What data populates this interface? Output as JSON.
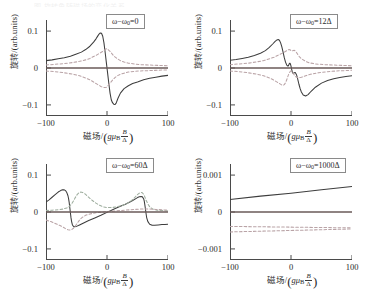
{
  "figure": {
    "caption_strip": "图 旋转角随磁场的变化关系",
    "axis": {
      "xlabel_cn": "磁场",
      "xlabel_slash": "/",
      "xlabel_g": "g",
      "xlabel_mu": "μ",
      "xlabel_mu_sub": "B",
      "xlabel_frac_num": "B",
      "xlabel_frac_den": "Δ",
      "ylabel_cn": "旋转",
      "ylabel_units": "/(arb.units)"
    },
    "xticks": [
      "-100",
      "0",
      "100"
    ],
    "xlim": [
      -100,
      100
    ]
  },
  "chart_data": [
    {
      "id": "panel-tl",
      "type": "line",
      "title": "",
      "annotation": "ω−ω₀=0",
      "annotation_prefix": "ω−ω",
      "annotation_sub": "0",
      "annotation_value": "=0",
      "xlabel": "磁场/(gμB B/Δ)",
      "ylabel": "旋转/(arb.units)",
      "xlim": [
        -100,
        100
      ],
      "ylim": [
        -0.13,
        0.13
      ],
      "yticks": [
        "0.1",
        "0",
        "-0.1"
      ],
      "ytick_values": [
        0.1,
        0,
        -0.1
      ],
      "grid": false,
      "legend": "none",
      "series": [
        {
          "name": "solid-dispersive",
          "style": "solid",
          "color": "#3d3d3d",
          "x": [
            -100,
            -90,
            -80,
            -70,
            -60,
            -50,
            -42,
            -35,
            -28,
            -22,
            -18,
            -15,
            -13,
            -11,
            -9,
            -7,
            -5,
            -3,
            -1,
            0,
            1,
            3,
            5,
            7,
            9,
            11,
            13,
            15,
            18,
            22,
            28,
            35,
            42,
            50,
            60,
            70,
            80,
            90,
            100
          ],
          "y": [
            0.02,
            0.022,
            0.025,
            0.028,
            0.032,
            0.038,
            0.043,
            0.05,
            0.059,
            0.07,
            0.079,
            0.087,
            0.092,
            0.095,
            0.094,
            0.086,
            0.068,
            0.042,
            0.014,
            0.0,
            -0.014,
            -0.042,
            -0.068,
            -0.086,
            -0.094,
            -0.098,
            -0.099,
            -0.095,
            -0.082,
            -0.068,
            -0.056,
            -0.048,
            -0.042,
            -0.038,
            -0.032,
            -0.028,
            -0.025,
            -0.022,
            -0.02
          ]
        },
        {
          "name": "dashed-upper",
          "style": "dashed",
          "color": "#b9a3a6",
          "x": [
            -100,
            -85,
            -70,
            -55,
            -45,
            -35,
            -28,
            -22,
            -17,
            -13,
            -10,
            -7,
            -5,
            -3,
            -1,
            0,
            1,
            3,
            5,
            7,
            10,
            13,
            17,
            22,
            28,
            35,
            45,
            55,
            70,
            85,
            100
          ],
          "y": [
            0.008,
            0.01,
            0.012,
            0.015,
            0.018,
            0.022,
            0.026,
            0.031,
            0.035,
            0.039,
            0.042,
            0.045,
            0.047,
            0.05,
            0.052,
            0.052,
            0.051,
            0.048,
            0.045,
            0.041,
            0.035,
            0.03,
            0.025,
            0.02,
            0.016,
            0.013,
            0.011,
            0.009,
            0.008,
            0.007,
            0.006
          ]
        },
        {
          "name": "dashed-lower",
          "style": "dashed",
          "color": "#b9a3a6",
          "x": [
            -100,
            -85,
            -70,
            -55,
            -45,
            -35,
            -28,
            -22,
            -17,
            -13,
            -10,
            -7,
            -5,
            -3,
            -1,
            0,
            1,
            3,
            5,
            7,
            10,
            13,
            17,
            22,
            28,
            35,
            45,
            55,
            70,
            85,
            100
          ],
          "y": [
            -0.008,
            -0.01,
            -0.013,
            -0.017,
            -0.021,
            -0.027,
            -0.032,
            -0.038,
            -0.043,
            -0.047,
            -0.05,
            -0.052,
            -0.053,
            -0.053,
            -0.052,
            -0.051,
            -0.049,
            -0.045,
            -0.041,
            -0.037,
            -0.031,
            -0.026,
            -0.021,
            -0.017,
            -0.014,
            -0.011,
            -0.009,
            -0.008,
            -0.007,
            -0.006,
            -0.005
          ]
        },
        {
          "name": "zero-baseline",
          "style": "solid",
          "color": "#6a5a58",
          "x": [
            -100,
            100
          ],
          "y": [
            0,
            0
          ]
        }
      ]
    },
    {
      "id": "panel-tr",
      "type": "line",
      "title": "",
      "annotation": "ω−ω₀=12Δ",
      "annotation_prefix": "ω−ω",
      "annotation_sub": "0",
      "annotation_value": "=12Δ",
      "xlabel": "磁场/(gμB B/Δ)",
      "ylabel": "旋转/(arb.units)",
      "xlim": [
        -100,
        100
      ],
      "ylim": [
        -0.13,
        0.13
      ],
      "yticks": [
        "0.1",
        "0",
        "-0.1"
      ],
      "ytick_values": [
        0.1,
        0,
        -0.1
      ],
      "grid": false,
      "legend": "none",
      "series": [
        {
          "name": "solid-dispersive",
          "style": "solid",
          "color": "#3d3d3d",
          "x": [
            -100,
            -90,
            -80,
            -70,
            -60,
            -50,
            -42,
            -36,
            -30,
            -26,
            -23,
            -21,
            -19,
            -17,
            -15,
            -13,
            -11,
            -9,
            -7,
            -5,
            -4,
            -3,
            -2,
            -1,
            0,
            1,
            2,
            3,
            4,
            5,
            7,
            9,
            11,
            13,
            15,
            17,
            20,
            24,
            28,
            33,
            40,
            50,
            60,
            70,
            80,
            90,
            100
          ],
          "y": [
            0.021,
            0.023,
            0.026,
            0.029,
            0.034,
            0.04,
            0.047,
            0.055,
            0.065,
            0.072,
            0.076,
            0.077,
            0.075,
            0.068,
            0.057,
            0.043,
            0.028,
            0.016,
            0.008,
            0.005,
            0.007,
            0.011,
            0.013,
            0.011,
            0.005,
            -0.003,
            -0.01,
            -0.014,
            -0.015,
            -0.013,
            -0.012,
            -0.018,
            -0.03,
            -0.044,
            -0.056,
            -0.065,
            -0.073,
            -0.076,
            -0.072,
            -0.063,
            -0.052,
            -0.041,
            -0.034,
            -0.029,
            -0.026,
            -0.023,
            -0.021
          ]
        },
        {
          "name": "dashed-upper",
          "style": "dashed",
          "color": "#b9a3a6",
          "x": [
            -100,
            -85,
            -70,
            -55,
            -45,
            -35,
            -28,
            -22,
            -17,
            -13,
            -10,
            -7,
            -5,
            -3,
            -1,
            0,
            1,
            3,
            5,
            7,
            9,
            11,
            14,
            18,
            24,
            30,
            40,
            55,
            70,
            85,
            100
          ],
          "y": [
            0.009,
            0.011,
            0.013,
            0.017,
            0.02,
            0.025,
            0.029,
            0.034,
            0.038,
            0.041,
            0.044,
            0.047,
            0.049,
            0.05,
            0.049,
            0.047,
            0.046,
            0.047,
            0.048,
            0.046,
            0.042,
            0.037,
            0.03,
            0.024,
            0.018,
            0.014,
            0.011,
            0.009,
            0.008,
            0.007,
            0.006
          ]
        },
        {
          "name": "dashed-lower",
          "style": "dashed",
          "color": "#b9a3a6",
          "x": [
            -100,
            -85,
            -70,
            -55,
            -45,
            -35,
            -28,
            -22,
            -18,
            -15,
            -13,
            -11,
            -9,
            -7,
            -5,
            -3,
            -1,
            0,
            1,
            3,
            5,
            8,
            12,
            17,
            24,
            32,
            45,
            60,
            75,
            90,
            100
          ],
          "y": [
            -0.008,
            -0.01,
            -0.013,
            -0.017,
            -0.021,
            -0.027,
            -0.033,
            -0.039,
            -0.043,
            -0.046,
            -0.047,
            -0.045,
            -0.04,
            -0.032,
            -0.022,
            -0.014,
            -0.009,
            -0.008,
            -0.009,
            -0.013,
            -0.018,
            -0.024,
            -0.027,
            -0.025,
            -0.021,
            -0.017,
            -0.013,
            -0.01,
            -0.008,
            -0.007,
            -0.006
          ]
        },
        {
          "name": "zero-baseline",
          "style": "solid",
          "color": "#6a5a58",
          "x": [
            -100,
            100
          ],
          "y": [
            0,
            0
          ]
        }
      ]
    },
    {
      "id": "panel-bl",
      "type": "line",
      "title": "",
      "annotation": "ω−ω₀=60Δ",
      "annotation_prefix": "ω−ω",
      "annotation_sub": "0",
      "annotation_value": "=60Δ",
      "xlabel": "磁场/(gμB B/Δ)",
      "ylabel": "旋转/(arb.units)",
      "xlim": [
        -100,
        100
      ],
      "ylim": [
        -0.13,
        0.13
      ],
      "yticks": [
        "0.1",
        "0",
        "-0.1"
      ],
      "ytick_values": [
        0.1,
        0,
        -0.1
      ],
      "grid": false,
      "legend": "none",
      "series": [
        {
          "name": "solid-dispersive",
          "style": "solid",
          "color": "#3d3d3d",
          "x": [
            -100,
            -95,
            -90,
            -85,
            -80,
            -76,
            -73,
            -70,
            -68,
            -66,
            -64,
            -63,
            -62,
            -61,
            -60,
            -59,
            -58,
            -57,
            -56,
            -54,
            -50,
            -45,
            -40,
            -30,
            -20,
            -10,
            0,
            10,
            20,
            30,
            40,
            46,
            50,
            53,
            56,
            58,
            60,
            61,
            62,
            63,
            64,
            65,
            67,
            70,
            74,
            78,
            84,
            90,
            95,
            100
          ],
          "y": [
            0.027,
            0.033,
            0.04,
            0.047,
            0.054,
            0.058,
            0.06,
            0.06,
            0.058,
            0.053,
            0.044,
            0.036,
            0.026,
            0.012,
            -0.002,
            -0.016,
            -0.026,
            -0.033,
            -0.037,
            -0.04,
            -0.039,
            -0.035,
            -0.031,
            -0.023,
            -0.016,
            -0.009,
            -0.001,
            0.007,
            0.014,
            0.021,
            0.029,
            0.035,
            0.039,
            0.041,
            0.042,
            0.041,
            0.036,
            0.03,
            0.02,
            0.008,
            -0.004,
            -0.015,
            -0.026,
            -0.033,
            -0.036,
            -0.036,
            -0.035,
            -0.034,
            -0.034,
            -0.033
          ]
        },
        {
          "name": "dashed-upper",
          "style": "dashed",
          "color": "#9fae9f",
          "x": [
            -100,
            -90,
            -80,
            -72,
            -66,
            -62,
            -58,
            -55,
            -52,
            -49,
            -46,
            -43,
            -40,
            -36,
            -32,
            -28,
            -24,
            -18,
            -12,
            -6,
            0,
            8,
            16,
            24,
            32,
            38,
            43,
            47,
            50,
            53,
            56,
            58,
            60,
            62,
            64,
            67,
            70,
            75,
            82,
            90,
            100
          ],
          "y": [
            0.004,
            0.005,
            0.006,
            0.008,
            0.011,
            0.015,
            0.022,
            0.03,
            0.039,
            0.047,
            0.052,
            0.054,
            0.053,
            0.049,
            0.043,
            0.037,
            0.031,
            0.024,
            0.018,
            0.014,
            0.012,
            0.012,
            0.014,
            0.017,
            0.022,
            0.028,
            0.035,
            0.042,
            0.047,
            0.051,
            0.053,
            0.052,
            0.048,
            0.041,
            0.032,
            0.022,
            0.014,
            0.008,
            0.005,
            0.004,
            0.003
          ]
        },
        {
          "name": "dashed-lower",
          "style": "dashed",
          "color": "#b9a3a6",
          "x": [
            -100,
            -92,
            -85,
            -78,
            -72,
            -68,
            -64,
            -61,
            -58,
            -55,
            -52,
            -49,
            -46,
            -43,
            -40,
            -35,
            -30,
            -24,
            -18,
            -12,
            -6,
            0,
            6,
            14,
            22,
            30,
            38,
            46,
            54,
            62,
            70,
            80,
            90,
            100
          ],
          "y": [
            -0.022,
            -0.026,
            -0.031,
            -0.036,
            -0.041,
            -0.045,
            -0.048,
            -0.049,
            -0.048,
            -0.044,
            -0.038,
            -0.031,
            -0.024,
            -0.018,
            -0.014,
            -0.009,
            -0.006,
            -0.004,
            -0.002,
            -0.001,
            0.0,
            0.001,
            0.002,
            0.003,
            0.004,
            0.005,
            0.006,
            0.007,
            0.008,
            0.008,
            0.008,
            0.007,
            0.006,
            0.005
          ]
        },
        {
          "name": "zero-baseline",
          "style": "solid",
          "color": "#6a5a58",
          "x": [
            -100,
            100
          ],
          "y": [
            0,
            0
          ]
        }
      ]
    },
    {
      "id": "panel-br",
      "type": "line",
      "title": "",
      "annotation": "ω−ω₀=1000Δ",
      "annotation_prefix": "ω−ω",
      "annotation_sub": "0",
      "annotation_value": "=1000Δ",
      "xlabel": "磁场/(gμB B/Δ)",
      "ylabel": "旋转/(arb.units)",
      "xlim": [
        -100,
        100
      ],
      "ylim": [
        -0.0013,
        0.0013
      ],
      "yticks": [
        "0.001",
        "0",
        "-0.001"
      ],
      "ytick_values": [
        0.001,
        0,
        -0.001
      ],
      "grid": false,
      "legend": "none",
      "series": [
        {
          "name": "solid-rising",
          "style": "solid",
          "color": "#3d3d3d",
          "x": [
            -100,
            -50,
            0,
            50,
            100
          ],
          "y": [
            0.00034,
            0.00043,
            0.00051,
            0.0006,
            0.00069
          ]
        },
        {
          "name": "dashed-upper",
          "style": "dashed",
          "color": "#b9a3a6",
          "x": [
            -100,
            -50,
            0,
            50,
            100
          ],
          "y": [
            -0.00039,
            -0.0004,
            -0.00041,
            -0.00042,
            -0.00043
          ]
        },
        {
          "name": "dashed-lower",
          "style": "dashed",
          "color": "#b9a3a6",
          "x": [
            -100,
            -50,
            0,
            50,
            100
          ],
          "y": [
            -0.00054,
            -0.00052,
            -0.0005,
            -0.00048,
            -0.00046
          ]
        },
        {
          "name": "zero-baseline",
          "style": "solid",
          "color": "#6a5a58",
          "x": [
            -100,
            100
          ],
          "y": [
            0,
            0
          ]
        }
      ]
    }
  ]
}
